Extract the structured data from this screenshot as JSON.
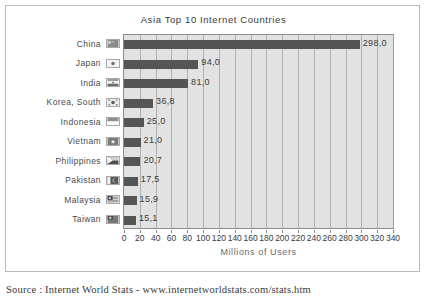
{
  "chart_data": {
    "type": "bar",
    "orientation": "horizontal",
    "title": "Asia Top 10 Internet Countries",
    "xlabel": "Millions of Users",
    "ylabel": "",
    "xlim": [
      0,
      340
    ],
    "xticks": [
      0,
      20,
      40,
      60,
      80,
      100,
      120,
      140,
      160,
      180,
      200,
      220,
      240,
      260,
      280,
      300,
      320,
      340
    ],
    "grid": "vertical",
    "legend": "none",
    "categories": [
      "China",
      "Japan",
      "India",
      "Korea, South",
      "Indonesia",
      "Vietnam",
      "Philippines",
      "Pakistan",
      "Malaysia",
      "Taiwan"
    ],
    "values": [
      298.0,
      94.0,
      81.0,
      36.8,
      25.0,
      21.0,
      20.7,
      17.5,
      15.9,
      15.1
    ],
    "value_labels": [
      "298,0",
      "94,0",
      "81,0",
      "36,8",
      "25,0",
      "21,0",
      "20,7",
      "17,5",
      "15,9",
      "15,1"
    ],
    "flags": [
      "china-flag-icon",
      "japan-flag-icon",
      "india-flag-icon",
      "south-korea-flag-icon",
      "indonesia-flag-icon",
      "vietnam-flag-icon",
      "philippines-flag-icon",
      "pakistan-flag-icon",
      "malaysia-flag-icon",
      "taiwan-flag-icon"
    ],
    "bar_color": "#555555",
    "plot_background": "#e2e2e2",
    "gridline_color": "#b0b0b0"
  },
  "caption": {
    "source": "Source : Internet World Stats - www.internetworldstats.com/stats.htm"
  }
}
